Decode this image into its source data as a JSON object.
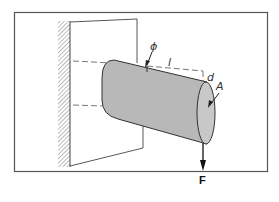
{
  "figure": {
    "labels": {
      "angle": "ϕ",
      "length": "l",
      "diameter": "d",
      "cross_section": "A",
      "force": "F"
    },
    "colors": {
      "frame": "#555555",
      "line": "#333333",
      "cylinder_fill": "#b8b8b8",
      "cylinder_end_fill": "#c8c8c8",
      "hatch": "#777777",
      "background": "#ffffff"
    }
  }
}
